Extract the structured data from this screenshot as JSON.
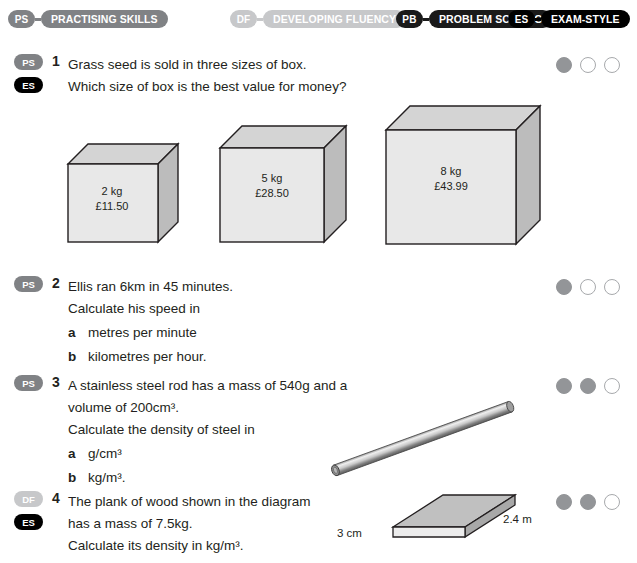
{
  "legend": [
    {
      "abbr": "PS",
      "name": "PRACTISING SKILLS",
      "tone": "ps",
      "color": "#808285"
    },
    {
      "abbr": "DF",
      "name": "DEVELOPING FLUENCY",
      "tone": "df",
      "color": "#c7c8ca"
    },
    {
      "abbr": "PB",
      "name": "PROBLEM SOLVING",
      "tone": "pb",
      "color": "#1a1a1a"
    },
    {
      "abbr": "ES",
      "name": "EXAM-STYLE",
      "tone": "es",
      "color": "#000000"
    }
  ],
  "questions": [
    {
      "number": "1",
      "tags": [
        "PS",
        "ES"
      ],
      "lines": [
        "Grass seed is sold in three sizes of box.",
        "Which size of box is the best value for money?"
      ],
      "subparts": [],
      "dots_filled": 1,
      "dots_total": 3
    },
    {
      "number": "2",
      "tags": [
        "PS"
      ],
      "lines": [
        "Ellis ran 6km in 45 minutes.",
        "Calculate his speed in"
      ],
      "subparts": [
        {
          "letter": "a",
          "text": "metres per minute"
        },
        {
          "letter": "b",
          "text": "kilometres per hour."
        }
      ],
      "dots_filled": 1,
      "dots_total": 3
    },
    {
      "number": "3",
      "tags": [
        "PS"
      ],
      "lines": [
        "A stainless steel rod has a mass of 540g and a",
        "volume of 200cm³.",
        "Calculate the density of steel in"
      ],
      "subparts": [
        {
          "letter": "a",
          "text": "g/cm³"
        },
        {
          "letter": "b",
          "text": "kg/m³."
        }
      ],
      "dots_filled": 2,
      "dots_total": 3
    },
    {
      "number": "4",
      "tags": [
        "DF",
        "ES"
      ],
      "lines": [
        "The plank of wood shown in the diagram",
        "has a mass of 7.5kg.",
        "Calculate its density in kg/m³."
      ],
      "subparts": [],
      "dots_filled": 2,
      "dots_total": 3
    }
  ],
  "boxes": [
    {
      "weight": "2 kg",
      "price": "£11.50"
    },
    {
      "weight": "5 kg",
      "price": "£28.50"
    },
    {
      "weight": "8 kg",
      "price": "£43.99"
    }
  ],
  "plank_dimensions": {
    "height": "3 cm",
    "length": "2.4 m"
  },
  "figure_colors": {
    "box_front": "#e8e8e8",
    "box_top": "#d4d4d4",
    "box_side": "#bcbcbc",
    "outline": "#231f20"
  }
}
